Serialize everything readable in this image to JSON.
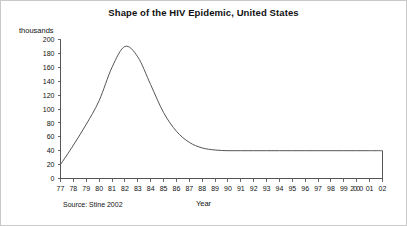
{
  "chart_data": {
    "type": "line",
    "title": "Shape of the HIV Epidemic, United States",
    "xlabel": "Year",
    "ylabel": "thousands",
    "source_note": "Source: Stine 2002",
    "grid": false,
    "legend": "none",
    "xlim": [
      1977,
      2002
    ],
    "ylim": [
      0,
      200
    ],
    "y_ticks": [
      0,
      20,
      40,
      60,
      80,
      100,
      120,
      140,
      160,
      180,
      200
    ],
    "y_tick_labels": [
      "0",
      "20",
      "40",
      "60",
      "80",
      "100",
      "120",
      "140",
      "160",
      "180",
      "200"
    ],
    "x_ticks": [
      1977,
      1978,
      1979,
      1980,
      1981,
      1982,
      1983,
      1984,
      1985,
      1986,
      1987,
      1988,
      1989,
      1990,
      1991,
      1992,
      1993,
      1994,
      1995,
      1996,
      1997,
      1998,
      1999,
      2000,
      2001,
      2002
    ],
    "x_tick_labels": [
      "77",
      "78",
      "79",
      "80",
      "81",
      "82",
      "83",
      "84",
      "85",
      "86",
      "87",
      "88",
      "89",
      "90",
      "91",
      "92",
      "93",
      "94",
      "95",
      "96",
      "97",
      "98",
      "99",
      "2000",
      "01",
      "02"
    ],
    "series": [
      {
        "name": "New HIV infections",
        "x": [
          1977,
          1978,
          1979,
          1980,
          1981,
          1982,
          1983,
          1984,
          1985,
          1986,
          1987,
          1988,
          1989,
          1990,
          1991,
          1992,
          1993,
          1994,
          1995,
          1996,
          1997,
          1998,
          1999,
          2000,
          2001,
          2002
        ],
        "values": [
          20,
          48,
          78,
          112,
          160,
          190,
          175,
          135,
          95,
          68,
          52,
          44,
          41,
          40,
          40,
          40,
          40,
          40,
          40,
          40,
          40,
          40,
          40,
          40,
          40,
          40
        ],
        "drop_to_zero_at_end": true
      }
    ]
  },
  "annotations": {
    "peak_year": 1982,
    "peak_value": 190,
    "plateau_value": 40,
    "start_value": 20
  }
}
